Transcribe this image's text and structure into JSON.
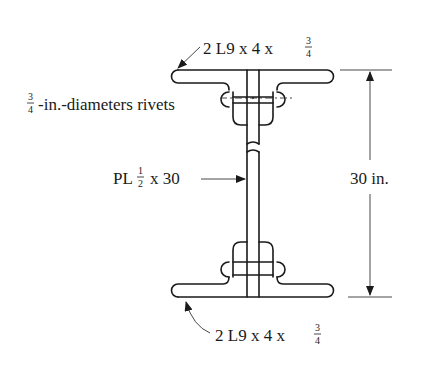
{
  "diagram": {
    "type": "built-up I-section (plate girder cross-section)",
    "labels": {
      "top_angles": {
        "main": "2 L9 x 4 x",
        "frac_num": "3",
        "frac_den": "4"
      },
      "rivets": {
        "frac_num": "3",
        "frac_den": "4",
        "text": "-in.-diameters rivets"
      },
      "web_plate": {
        "prefix": "PL",
        "frac_num": "1",
        "frac_den": "2",
        "suffix": "x 30"
      },
      "depth_dimension": "30 in.",
      "bottom_angles": {
        "main": "2 L9 x 4 x",
        "frac_num": "3",
        "frac_den": "4"
      }
    },
    "components": [
      {
        "name": "top flange angles",
        "spec": "2 L9 x 4 x 3/4"
      },
      {
        "name": "web plate",
        "spec": "PL 1/2 x 30"
      },
      {
        "name": "rivets",
        "spec": "3/4-in.-diameter"
      },
      {
        "name": "bottom flange angles",
        "spec": "2 L9 x 4 x 3/4"
      }
    ],
    "colors": {
      "line": "#1a1a1a",
      "background": "#ffffff"
    }
  }
}
